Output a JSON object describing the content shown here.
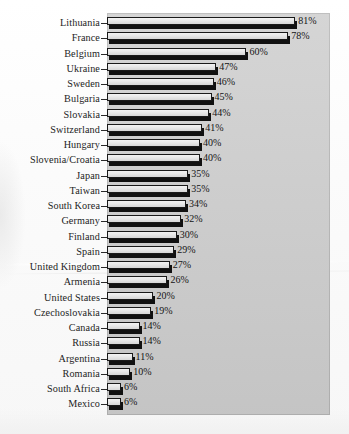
{
  "chart_data": {
    "type": "bar",
    "orientation": "horizontal",
    "title": "",
    "subtitle": "",
    "xlabel": "",
    "ylabel": "",
    "xlim": [
      0,
      88
    ],
    "grid": false,
    "legend": null,
    "value_suffix": "%",
    "categories": [
      "Lithuania",
      "France",
      "Belgium",
      "Ukraine",
      "Sweden",
      "Bulgaria",
      "Slovakia",
      "Switzerland",
      "Hungary",
      "Slovenia/Croatia",
      "Japan",
      "Taiwan",
      "South Korea",
      "Germany",
      "Finland",
      "Spain",
      "United Kingdom",
      "Armenia",
      "United States",
      "Czechoslovakia",
      "Canada",
      "Russia",
      "Argentina",
      "Romania",
      "South Africa",
      "Mexico"
    ],
    "values": [
      81,
      78,
      60,
      47,
      46,
      45,
      44,
      41,
      40,
      40,
      35,
      35,
      34,
      32,
      30,
      29,
      27,
      26,
      20,
      19,
      14,
      14,
      11,
      10,
      6,
      6
    ],
    "data_labels": [
      "81%",
      "78%",
      "60%",
      "47%",
      "46%",
      "45%",
      "44%",
      "41%",
      "40%",
      "40%",
      "35%",
      "35%",
      "34%",
      "32%",
      "30%",
      "29%",
      "27%",
      "26%",
      "20%",
      "19%",
      "14%",
      "14%",
      "11%",
      "10%",
      "6%",
      "6%"
    ]
  },
  "style": {
    "plot_background": "#cfcfcf",
    "bar_fill": "#e8e8e8",
    "bar_outline": "#1a1a1a",
    "bar_shadow": "#111111",
    "text_color": "#1d1d1d",
    "page_background": "#fdfdfd"
  }
}
